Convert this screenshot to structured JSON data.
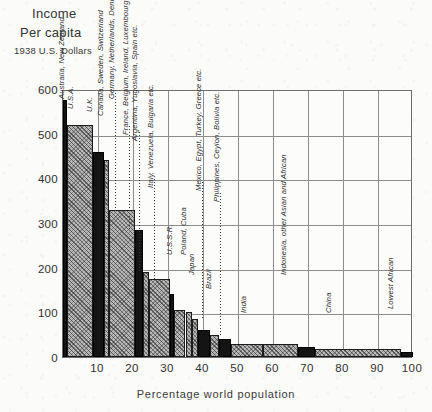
{
  "titles": {
    "line1": "Income",
    "line2": "Per capita",
    "line3": "1938 U.S. Dollars",
    "xaxis": "Percentage world population"
  },
  "axes": {
    "y_ticks": [
      "600",
      "500",
      "400",
      "300",
      "200",
      "100",
      "0"
    ],
    "x_ticks": [
      "10",
      "20",
      "30",
      "40",
      "50",
      "60",
      "70",
      "80",
      "90",
      "100"
    ]
  },
  "chart_data": {
    "type": "bar",
    "title": "Income Per capita 1938 U.S. Dollars",
    "xlabel": "Percentage world population",
    "ylabel": "Income Per capita (1938 U.S. Dollars)",
    "xlim": [
      0,
      100
    ],
    "ylim": [
      0,
      600
    ],
    "grid": true,
    "legend": null,
    "note": "Cumulative-population step histogram: each bar spans a share of world population (x) at its per-capita income level (y).",
    "bars": [
      {
        "label": "Australia, New Zealand",
        "x_start": 0.0,
        "x_end": 1.2,
        "value": 575,
        "style": "solid"
      },
      {
        "label": "U.S.A.",
        "x_start": 1.2,
        "x_end": 8.5,
        "value": 520,
        "style": "hatch"
      },
      {
        "label": "U.K.",
        "x_start": 8.5,
        "x_end": 11.8,
        "value": 460,
        "style": "solid"
      },
      {
        "label": "Canada, Sweden, Switzerland",
        "x_start": 11.8,
        "x_end": 13.2,
        "value": 440,
        "style": "hatch"
      },
      {
        "label": "Germany, Netherlands, Denmark, Norway",
        "x_start": 13.2,
        "x_end": 20.5,
        "value": 330,
        "style": "hatch"
      },
      {
        "label": "France, Belgium, Ireland, Luxembourg",
        "x_start": 20.5,
        "x_end": 22.8,
        "value": 285,
        "style": "solid"
      },
      {
        "label": "Argentina, Yugoslavia, Spain etc.",
        "x_start": 22.8,
        "x_end": 24.5,
        "value": 190,
        "style": "hatch"
      },
      {
        "label": "Italy, Venezuela, Bulgaria etc.",
        "x_start": 24.5,
        "x_end": 30.5,
        "value": 175,
        "style": "hatch"
      },
      {
        "label": "U.S.S.R.",
        "x_start": 30.5,
        "x_end": 31.8,
        "value": 140,
        "style": "solid"
      },
      {
        "label": "Poland, Cuba",
        "x_start": 31.8,
        "x_end": 35.0,
        "value": 105,
        "style": "hatch"
      },
      {
        "label": "Japan",
        "x_start": 35.0,
        "x_end": 36.8,
        "value": 100,
        "style": "hatch"
      },
      {
        "label": "Mexico, Egypt, Turkey, Greece etc.",
        "x_start": 36.8,
        "x_end": 38.5,
        "value": 85,
        "style": "hatch"
      },
      {
        "label": "Brazil",
        "x_start": 38.5,
        "x_end": 42.0,
        "value": 60,
        "style": "solid"
      },
      {
        "label": "Philippines, Ceylon, Bolivia etc.",
        "x_start": 42.0,
        "x_end": 44.5,
        "value": 50,
        "style": "hatch"
      },
      {
        "label": "India",
        "x_start": 44.5,
        "x_end": 48.0,
        "value": 40,
        "style": "solid"
      },
      {
        "label": "Indonesia, other Asian and African",
        "x_start": 48.0,
        "x_end": 57.0,
        "value": 30,
        "style": "hatch"
      },
      {
        "label": "China",
        "x_start": 57.0,
        "x_end": 67.0,
        "value": 30,
        "style": "hatch"
      },
      {
        "label": "Lowest African",
        "x_start": 67.0,
        "x_end": 72.0,
        "value": 22,
        "style": "solid"
      },
      {
        "label": "",
        "x_start": 72.0,
        "x_end": 96.5,
        "value": 18,
        "style": "hatch"
      },
      {
        "label": "",
        "x_start": 96.5,
        "x_end": 100.0,
        "value": 11,
        "style": "solid"
      }
    ],
    "label_placement": [
      {
        "label": "Australia, New Zealand",
        "lx": 1.0,
        "ly_top": 600,
        "leader": false
      },
      {
        "label": "U.S.A.",
        "lx": 3.6,
        "ly_top": 578,
        "leader": false
      },
      {
        "label": "U.K.",
        "lx": 9.2,
        "ly_top": 572,
        "leader": false
      },
      {
        "label": "Canada, Sweden, Switzerland",
        "lx": 12.3,
        "ly_top": 562,
        "leader": false
      },
      {
        "label": "Germany, Netherlands, Denmark, Norway",
        "lx": 15.3,
        "ly_top": 600,
        "leader": true
      },
      {
        "label": "France, Belgium, Ireland, Luxembourg",
        "lx": 19.4,
        "ly_top": 520,
        "leader": true
      },
      {
        "label": "Argentina, Yugoslavia, Spain etc.",
        "lx": 22.0,
        "ly_top": 505,
        "leader": true
      },
      {
        "label": "Italy, Venezuela, Bulgaria etc.",
        "lx": 26.5,
        "ly_top": 400,
        "leader": true
      },
      {
        "label": "U.S.S.R.",
        "lx": 32.0,
        "ly_top": 250,
        "leader": false
      },
      {
        "label": "Poland, Cuba",
        "lx": 36.0,
        "ly_top": 250,
        "leader": false
      },
      {
        "label": "Japan",
        "lx": 38.2,
        "ly_top": 205,
        "leader": false
      },
      {
        "label": "Mexico, Egypt, Turkey, Greece etc.",
        "lx": 40.2,
        "ly_top": 395,
        "leader": true
      },
      {
        "label": "Brazil",
        "lx": 43.2,
        "ly_top": 175,
        "leader": false
      },
      {
        "label": "Philippines, Ceylon, Bolivia etc.",
        "lx": 45.3,
        "ly_top": 370,
        "leader": true
      },
      {
        "label": "India",
        "lx": 53.0,
        "ly_top": 120,
        "leader": false
      },
      {
        "label": "Indonesia, other Asian and African",
        "lx": 64.5,
        "ly_top": 205,
        "leader": false
      },
      {
        "label": "China",
        "lx": 77.5,
        "ly_top": 120,
        "leader": false
      },
      {
        "label": "Lowest African",
        "lx": 95.0,
        "ly_top": 130,
        "leader": false
      }
    ]
  }
}
